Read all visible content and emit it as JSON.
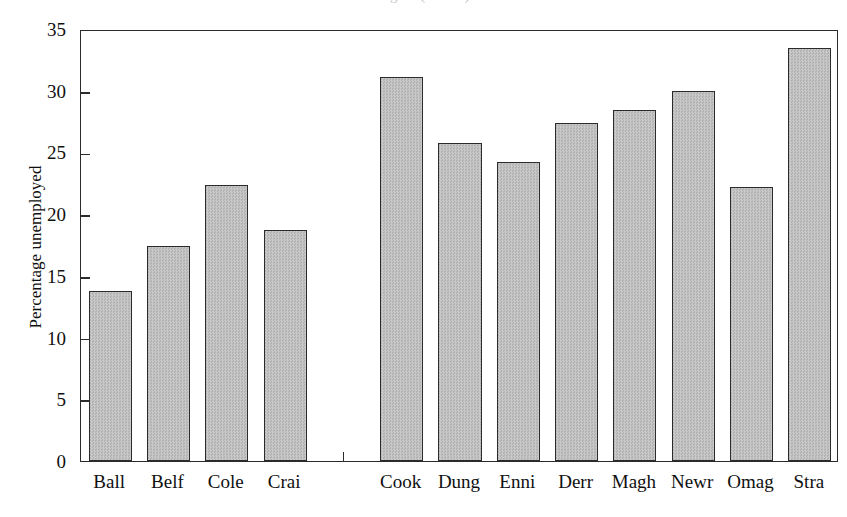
{
  "chart_data": {
    "type": "bar",
    "title": "Figure (cut off)",
    "xlabel": "",
    "ylabel": "Percentage unemployed",
    "ylim": [
      0,
      35
    ],
    "ytick_values": [
      0,
      5,
      10,
      15,
      20,
      25,
      30,
      35
    ],
    "ytick_labels": [
      "0",
      "5",
      "10",
      "15",
      "20",
      "25",
      "30",
      "35"
    ],
    "grid": false,
    "legend": false,
    "bar_color": "#bfbfbf",
    "bar_edge_color": "#2b2b2b",
    "axis_color": "#2b2b2b",
    "background_color": "#ffffff",
    "categories": [
      "Ball",
      "Belf",
      "Cole",
      "Crai",
      "",
      "Cook",
      "Dung",
      "Enni",
      "Derr",
      "Magh",
      "Newr",
      "Omag",
      "Stra"
    ],
    "values": [
      13.8,
      17.4,
      22.4,
      18.7,
      null,
      31.1,
      25.8,
      24.2,
      27.4,
      28.4,
      30.0,
      22.2,
      33.5
    ],
    "points": [
      {
        "category": "Ball",
        "value": 13.8
      },
      {
        "category": "Belf",
        "value": 17.4
      },
      {
        "category": "Cole",
        "value": 22.4
      },
      {
        "category": "Crai",
        "value": 18.7
      },
      {
        "category": "",
        "value": null
      },
      {
        "category": "Cook",
        "value": 31.1
      },
      {
        "category": "Dung",
        "value": 25.8
      },
      {
        "category": "Enni",
        "value": 24.2
      },
      {
        "category": "Derr",
        "value": 27.4
      },
      {
        "category": "Magh",
        "value": 28.4
      },
      {
        "category": "Newr",
        "value": 30.0
      },
      {
        "category": "Omag",
        "value": 22.2
      },
      {
        "category": "Stra",
        "value": 33.5
      }
    ]
  }
}
